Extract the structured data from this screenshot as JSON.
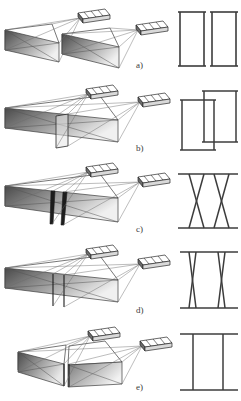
{
  "figure": {
    "type": "technical-diagram",
    "domain": "photogrammetry-facade-reconstruction",
    "width": 241,
    "height": 401,
    "background_color": "#ffffff",
    "line_color": "#3c3c3c",
    "gradient_dark": "#4a4a4a",
    "gradient_light": "#f2f2f2",
    "sensor_fill": "#ffffff",
    "ray_color": "#6b6b6b"
  },
  "panels": [
    {
      "id": "a",
      "label": "a)",
      "label_x": 136,
      "label_y": 60,
      "scene_description": "Two separate facade planes, each viewed by its own sensor; planes are disjoint with a visible gap",
      "facade_count": 2,
      "facade_gap": true,
      "seam_lines": 0,
      "sensors": 2,
      "schematic": {
        "type": "two-separate-rectangles",
        "description": "Two independent closed rectangles side by side, no shared edges"
      }
    },
    {
      "id": "b",
      "label": "b)",
      "label_x": 136,
      "label_y": 143,
      "scene_description": "Two facade planes that overlap; one plane protrudes in front of the other producing a step",
      "facade_count": 2,
      "facade_gap": false,
      "seam_lines": 2,
      "sensors": 2,
      "schematic": {
        "type": "two-offset-overlapping-rectangles",
        "description": "Two rectangles offset vertically and horizontally so their outlines overlap"
      }
    },
    {
      "id": "c",
      "label": "c)",
      "label_x": 136,
      "label_y": 226,
      "scene_description": "Single merged facade block with two narrow wedge-shaped seams cut through the front face",
      "facade_count": 1,
      "facade_gap": false,
      "seam_lines": 2,
      "sensors": 2,
      "schematic": {
        "type": "two-wide-x-crossings",
        "description": "Top and bottom horizontal bars joined by two wide hourglass X crossings"
      }
    },
    {
      "id": "d",
      "label": "d)",
      "label_x": 136,
      "label_y": 305,
      "scene_description": "Single merged facade block with two thin vertical seams",
      "facade_count": 1,
      "facade_gap": false,
      "seam_lines": 2,
      "sensors": 2,
      "schematic": {
        "type": "two-narrow-x-crossings",
        "description": "Top and bottom horizontal bars joined by two very narrow, nearly vertical X crossings"
      }
    },
    {
      "id": "e",
      "label": "e)",
      "label_x": 136,
      "label_y": 382,
      "scene_description": "Two abutting facade planes forming a continuous block with a single shared boundary",
      "facade_count": 2,
      "facade_gap": false,
      "seam_lines": 2,
      "sensors": 2,
      "schematic": {
        "type": "two-parallel-verticals",
        "description": "Top and bottom horizontal bars joined by two straight parallel vertical lines"
      }
    }
  ]
}
